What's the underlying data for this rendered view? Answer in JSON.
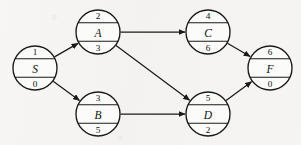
{
  "diagram": {
    "type": "directed-graph",
    "title": "",
    "background_color": "#f6f5f3",
    "stroke_color": "#1a1a1a",
    "node_fill_color": "#fbfbfa",
    "nodes": [
      {
        "id": "S",
        "label": "S",
        "top_value": "1",
        "bottom_value": "0",
        "cx": 35,
        "cy": 68,
        "r": 22
      },
      {
        "id": "A",
        "label": "A",
        "top_value": "2",
        "bottom_value": "3",
        "cx": 98,
        "cy": 32,
        "r": 22
      },
      {
        "id": "B",
        "label": "B",
        "top_value": "3",
        "bottom_value": "5",
        "cx": 98,
        "cy": 114,
        "r": 22
      },
      {
        "id": "C",
        "label": "C",
        "top_value": "4",
        "bottom_value": "6",
        "cx": 208,
        "cy": 32,
        "r": 22
      },
      {
        "id": "D",
        "label": "D",
        "top_value": "5",
        "bottom_value": "2",
        "cx": 208,
        "cy": 114,
        "r": 22
      },
      {
        "id": "F",
        "label": "F",
        "top_value": "6",
        "bottom_value": "0",
        "cx": 270,
        "cy": 68,
        "r": 22
      }
    ],
    "edges": [
      {
        "from": "S",
        "to": "A",
        "directed": true
      },
      {
        "from": "S",
        "to": "B",
        "directed": true
      },
      {
        "from": "A",
        "to": "C",
        "directed": true
      },
      {
        "from": "A",
        "to": "D",
        "directed": true
      },
      {
        "from": "B",
        "to": "D",
        "directed": true
      },
      {
        "from": "C",
        "to": "F",
        "directed": true
      },
      {
        "from": "D",
        "to": "F",
        "directed": true
      }
    ]
  }
}
